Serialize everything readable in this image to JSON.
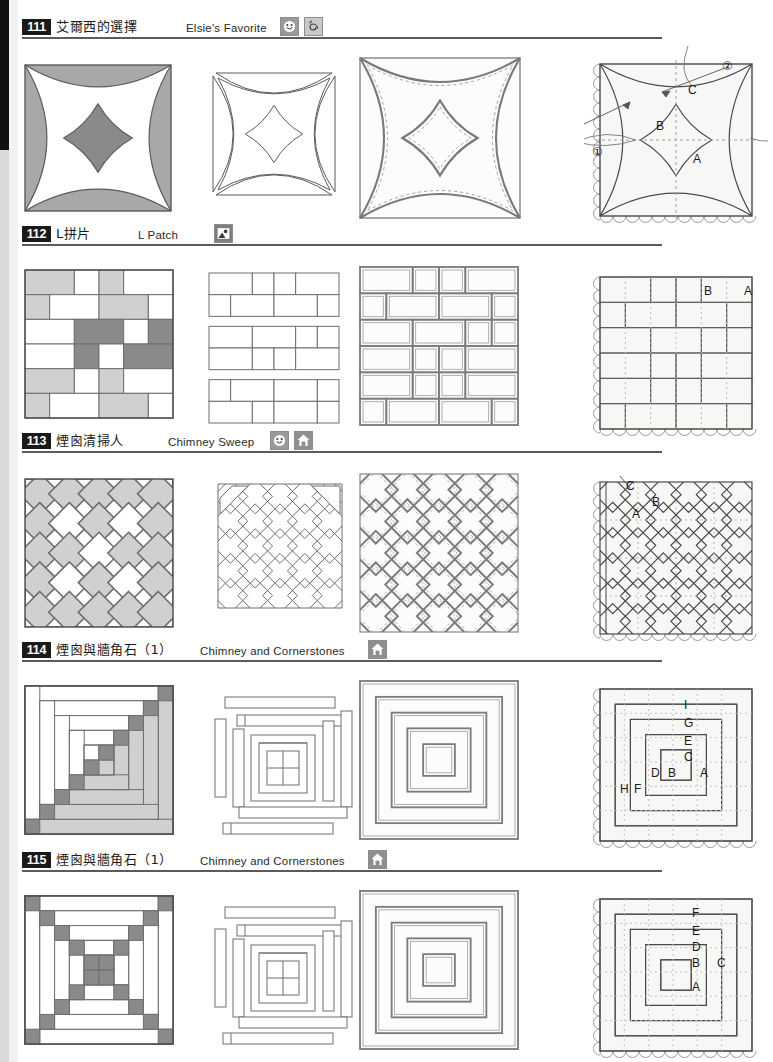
{
  "page": {
    "width": 773,
    "height": 1062,
    "background": "#ffffff",
    "edge_color": "#111111"
  },
  "palette": {
    "light_gray": "#d0d0d0",
    "mid_gray": "#a8a8a8",
    "dark_gray": "#8a8a8a",
    "line": "#5b5b5b",
    "dashed": "#9a9a9a",
    "white": "#ffffff",
    "panel_fill": "#f7f7f5"
  },
  "sections": [
    {
      "number": "111",
      "title_cn": "艾爾西的選擇",
      "title_en": "Elsie's Favorite",
      "icons": [
        "smile-icon",
        "spiral-icon"
      ],
      "top": 18,
      "rule_width": 640,
      "en_left": 168,
      "icon_left": 262,
      "panels": [
        {
          "name": "pieced-block-preview",
          "type": "curved-star-color"
        },
        {
          "name": "piecing-units-diagram",
          "type": "curved-star-units"
        },
        {
          "name": "quilting-lines-diagram",
          "type": "curved-star-quilting"
        },
        {
          "name": "template-labels-diagram",
          "type": "curved-star-templates",
          "labels": [
            "A",
            "B",
            "C"
          ],
          "callouts": [
            "①",
            "②"
          ]
        }
      ]
    },
    {
      "number": "112",
      "title_cn": "L拼片",
      "title_en": "L Patch",
      "icons": [
        "picture-icon"
      ],
      "top": 225,
      "rule_width": 640,
      "en_left": 120,
      "icon_left": 196,
      "panels": [
        {
          "name": "pieced-block-preview",
          "type": "lpatch-color"
        },
        {
          "name": "piecing-units-diagram",
          "type": "lpatch-units"
        },
        {
          "name": "quilting-lines-diagram",
          "type": "lpatch-quilting"
        },
        {
          "name": "template-labels-diagram",
          "type": "lpatch-templates",
          "labels": [
            "A",
            "B"
          ]
        }
      ]
    },
    {
      "number": "113",
      "title_cn": "煙囪清掃人",
      "title_en": "Chimney Sweep",
      "icons": [
        "smile-icon",
        "house-icon"
      ],
      "top": 432,
      "rule_width": 640,
      "en_left": 150,
      "icon_left": 252,
      "panels": [
        {
          "name": "pieced-block-preview",
          "type": "chimney-color"
        },
        {
          "name": "piecing-units-diagram",
          "type": "chimney-units"
        },
        {
          "name": "quilting-lines-diagram",
          "type": "chimney-quilting"
        },
        {
          "name": "template-labels-diagram",
          "type": "chimney-templates",
          "labels": [
            "A",
            "B",
            "C"
          ]
        }
      ]
    },
    {
      "number": "114",
      "title_cn": "煙囪與牆角石（1）",
      "title_en": "Chimney and Cornerstones",
      "icons": [
        "house-icon"
      ],
      "top": 641,
      "rule_width": 640,
      "en_left": 182,
      "icon_left": 350,
      "panels": [
        {
          "name": "pieced-block-preview",
          "type": "logcabin114-color"
        },
        {
          "name": "piecing-units-diagram",
          "type": "logcabin114-units"
        },
        {
          "name": "quilting-lines-diagram",
          "type": "logcabin114-quilting"
        },
        {
          "name": "template-labels-diagram",
          "type": "logcabin114-templates",
          "labels": [
            "A",
            "B",
            "C",
            "D",
            "E",
            "F",
            "G",
            "H",
            "I"
          ]
        }
      ]
    },
    {
      "number": "115",
      "title_cn": "煙囪與牆角石（1）",
      "title_en": "Chimney and Cornerstones",
      "icons": [
        "house-icon"
      ],
      "top": 851,
      "rule_width": 640,
      "en_left": 182,
      "icon_left": 350,
      "panels": [
        {
          "name": "pieced-block-preview",
          "type": "logcabin115-color"
        },
        {
          "name": "piecing-units-diagram",
          "type": "logcabin115-units"
        },
        {
          "name": "quilting-lines-diagram",
          "type": "logcabin115-quilting"
        },
        {
          "name": "template-labels-diagram",
          "type": "logcabin115-templates",
          "labels": [
            "A",
            "B",
            "C",
            "D",
            "E",
            "F"
          ]
        }
      ]
    }
  ],
  "template_labels": {
    "s111": [
      {
        "t": "C",
        "x": 88,
        "y": 30
      },
      {
        "t": "B",
        "x": 56,
        "y": 66
      },
      {
        "t": "A",
        "x": 93,
        "y": 99
      },
      {
        "t": "②",
        "x": 122,
        "y": 6
      },
      {
        "t": "①",
        "x": -8,
        "y": 92
      }
    ],
    "s112": [
      {
        "t": "B",
        "x": 104,
        "y": 18
      },
      {
        "t": "A",
        "x": 144,
        "y": 18
      }
    ],
    "s113": [
      {
        "t": "C",
        "x": 26,
        "y": 8
      },
      {
        "t": "B",
        "x": 52,
        "y": 24
      },
      {
        "t": "A",
        "x": 32,
        "y": 36
      }
    ],
    "s114": [
      {
        "t": "I",
        "x": 84,
        "y": 20
      },
      {
        "t": "G",
        "x": 84,
        "y": 38
      },
      {
        "t": "E",
        "x": 84,
        "y": 56
      },
      {
        "t": "C",
        "x": 84,
        "y": 72
      },
      {
        "t": "D",
        "x": 51,
        "y": 88
      },
      {
        "t": "B",
        "x": 68,
        "y": 88
      },
      {
        "t": "A",
        "x": 100,
        "y": 88
      },
      {
        "t": "H",
        "x": 20,
        "y": 104
      },
      {
        "t": "F",
        "x": 34,
        "y": 104
      }
    ],
    "s115": [
      {
        "t": "F",
        "x": 92,
        "y": 18
      },
      {
        "t": "E",
        "x": 92,
        "y": 36
      },
      {
        "t": "D",
        "x": 92,
        "y": 52
      },
      {
        "t": "B",
        "x": 92,
        "y": 68
      },
      {
        "t": "C",
        "x": 117,
        "y": 68
      },
      {
        "t": "A",
        "x": 92,
        "y": 92
      }
    ]
  }
}
